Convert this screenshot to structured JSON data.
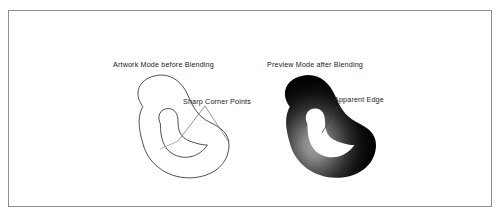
{
  "figure": {
    "kind": "technical-illustration",
    "background_color": "#ffffff",
    "frame_color": "#8f8f8f",
    "ink_color": "#1a1a1a",
    "panels": [
      {
        "id": "artwork-mode",
        "caption": "Artwork Mode before Blending",
        "render_style": "outline",
        "shape": "bean-with-inner-notch",
        "stroke_color": "#2b2b2b",
        "fill_color": "none"
      },
      {
        "id": "preview-mode",
        "caption": "Preview Mode after Blending",
        "render_style": "filled-gradient",
        "shape": "bean-with-inner-notch",
        "stroke_color": "none",
        "fill_dark_color": "#050505",
        "fill_highlight_color": "#9a9a9a"
      }
    ],
    "callouts": [
      {
        "id": "sharp-corner-points",
        "label": "Sharp Corner Points",
        "leader_style": "two-branch-v",
        "leader_color": "#555555",
        "points_to": "artwork-mode"
      },
      {
        "id": "apparent-edge",
        "label": "Apparent Edge",
        "leader_style": "single-diagonal",
        "leader_color": "#333333",
        "points_to": "preview-mode"
      }
    ]
  }
}
